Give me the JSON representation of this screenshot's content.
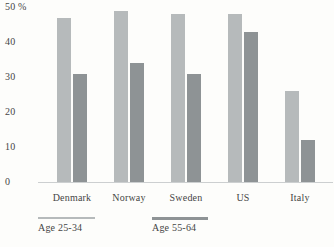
{
  "chart_data": {
    "type": "bar",
    "categories": [
      "Denmark",
      "Norway",
      "Sweden",
      "US",
      "Italy"
    ],
    "series": [
      {
        "name": "Age 25-34",
        "values": [
          47,
          49,
          48,
          48,
          26
        ],
        "color": "#b6babb"
      },
      {
        "name": "Age 55-64",
        "values": [
          31,
          34,
          31,
          43,
          12
        ],
        "color": "#8e9395"
      }
    ],
    "title": "",
    "xlabel": "",
    "ylabel": "",
    "unit": "%",
    "ylim": [
      0,
      50
    ],
    "yticks": [
      0,
      10,
      20,
      30,
      40,
      50
    ],
    "ytick_labels": [
      "0",
      "10",
      "20",
      "30",
      "40",
      "50 %"
    ],
    "grid": false,
    "legend_position": "bottom"
  },
  "legend": {
    "items": [
      {
        "label": "Age 25-34",
        "color": "#b6babb",
        "thickness": 2
      },
      {
        "label": "Age 55-64",
        "color": "#8e9395",
        "thickness": 3
      }
    ]
  },
  "colors": {
    "background": "#fdfdfb",
    "axis_line": "#cccfd0",
    "text": "#454545",
    "bar_light": "#b6babb",
    "bar_dark": "#8e9395"
  }
}
